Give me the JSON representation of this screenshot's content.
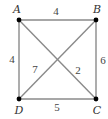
{
  "diagram": {
    "type": "weighted-graph",
    "colors": {
      "edge": "#8a8a8a",
      "vertex": "#000000",
      "label": "#333333"
    },
    "vertices": [
      {
        "id": "A",
        "label": "A",
        "x": 19,
        "y": 20,
        "lx": 17,
        "ly": 13
      },
      {
        "id": "B",
        "label": "B",
        "x": 96,
        "y": 20,
        "lx": 97,
        "ly": 13
      },
      {
        "id": "C",
        "label": "C",
        "x": 96,
        "y": 99,
        "lx": 97,
        "ly": 114
      },
      {
        "id": "D",
        "label": "D",
        "x": 19,
        "y": 99,
        "lx": 19,
        "ly": 114
      }
    ],
    "edges": [
      {
        "from": "A",
        "to": "B",
        "weight": "4",
        "wx": 56,
        "wy": 15
      },
      {
        "from": "A",
        "to": "D",
        "weight": "4",
        "wx": 12,
        "wy": 63
      },
      {
        "from": "B",
        "to": "C",
        "weight": "6",
        "wx": 103,
        "wy": 64
      },
      {
        "from": "D",
        "to": "C",
        "weight": "5",
        "wx": 57,
        "wy": 111
      },
      {
        "from": "B",
        "to": "D",
        "weight": "7",
        "wx": 35,
        "wy": 73
      },
      {
        "from": "A",
        "to": "C",
        "weight": "2",
        "wx": 78,
        "wy": 74
      }
    ]
  }
}
